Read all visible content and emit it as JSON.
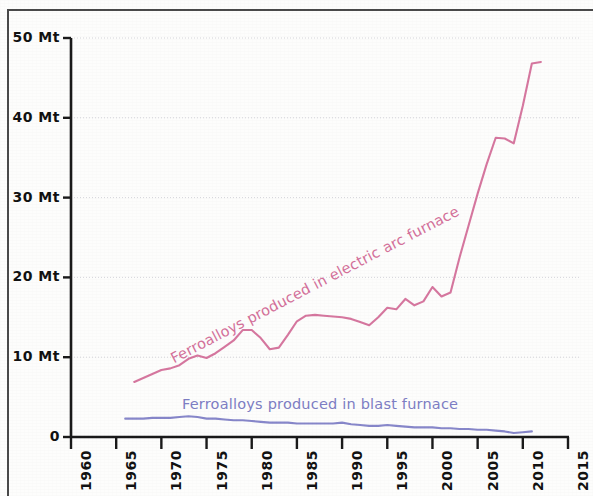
{
  "chart_data": {
    "type": "line",
    "title": "",
    "xlabel": "",
    "ylabel": "",
    "xlim": [
      1960,
      2015
    ],
    "ylim": [
      0,
      50
    ],
    "grid": true,
    "legend_position": "inline-on-series",
    "y_tick_labels": [
      "50 Mt",
      "40 Mt",
      "30 Mt",
      "20 Mt",
      "10 Mt",
      "0"
    ],
    "y_ticks": [
      50,
      40,
      30,
      20,
      10,
      0
    ],
    "x_tick_labels": [
      "1960",
      "1965",
      "1970",
      "1975",
      "1980",
      "1985",
      "1990",
      "1995",
      "2000",
      "2005",
      "2010",
      "2015"
    ],
    "x_ticks": [
      1960,
      1965,
      1970,
      1975,
      1980,
      1985,
      1990,
      1995,
      2000,
      2005,
      2010,
      2015
    ],
    "y_unit": "Mt",
    "series": [
      {
        "name": "Ferroalloys produced in electric arc furnace",
        "color": "#d4709a",
        "x": [
          1967,
          1968,
          1969,
          1970,
          1971,
          1972,
          1973,
          1974,
          1975,
          1976,
          1977,
          1978,
          1979,
          1980,
          1981,
          1982,
          1983,
          1984,
          1985,
          1986,
          1987,
          1988,
          1989,
          1990,
          1991,
          1992,
          1993,
          1994,
          1995,
          1996,
          1997,
          1998,
          1999,
          2000,
          2001,
          2002,
          2003,
          2004,
          2005,
          2006,
          2007,
          2008,
          2009,
          2010,
          2011,
          2012
        ],
        "values": [
          6.9,
          7.4,
          7.9,
          8.4,
          8.6,
          9.0,
          9.8,
          10.2,
          9.9,
          10.5,
          11.3,
          12.1,
          13.4,
          13.4,
          12.4,
          11.0,
          11.2,
          12.8,
          14.5,
          15.2,
          15.3,
          15.2,
          15.1,
          15.0,
          14.8,
          14.4,
          14.0,
          15.0,
          16.2,
          16.0,
          17.3,
          16.5,
          17.0,
          18.8,
          17.6,
          18.1,
          22.5,
          26.5,
          30.5,
          34.2,
          37.5,
          37.4,
          36.8,
          41.5,
          46.8,
          47.0
        ]
      },
      {
        "name": "Ferroalloys produced in blast furnace",
        "color": "#8181c7",
        "x": [
          1966,
          1967,
          1968,
          1969,
          1970,
          1971,
          1972,
          1973,
          1974,
          1975,
          1976,
          1977,
          1978,
          1979,
          1980,
          1981,
          1982,
          1983,
          1984,
          1985,
          1986,
          1987,
          1988,
          1989,
          1990,
          1991,
          1992,
          1993,
          1994,
          1995,
          1996,
          1997,
          1998,
          1999,
          2000,
          2001,
          2002,
          2003,
          2004,
          2005,
          2006,
          2007,
          2008,
          2009,
          2010,
          2011
        ],
        "values": [
          2.3,
          2.3,
          2.3,
          2.4,
          2.4,
          2.4,
          2.5,
          2.6,
          2.5,
          2.3,
          2.3,
          2.2,
          2.1,
          2.1,
          2.0,
          1.9,
          1.8,
          1.8,
          1.8,
          1.7,
          1.7,
          1.7,
          1.7,
          1.7,
          1.8,
          1.6,
          1.5,
          1.4,
          1.4,
          1.5,
          1.4,
          1.3,
          1.2,
          1.2,
          1.2,
          1.1,
          1.1,
          1.0,
          1.0,
          0.9,
          0.9,
          0.8,
          0.7,
          0.5,
          0.6,
          0.7
        ]
      }
    ],
    "annotations": [
      {
        "name": "eaf-inline-label",
        "text": "Ferroalloys produced in electric arc furnace",
        "color": "#d4709a"
      },
      {
        "name": "bf-inline-label",
        "text": "Ferroalloys produced in blast furnace",
        "color": "#7e7ec4"
      }
    ]
  },
  "axes": {
    "y_labels": [
      "50 Mt",
      "40 Mt",
      "30 Mt",
      "20 Mt",
      "10 Mt",
      "0"
    ],
    "x_labels": [
      "1960",
      "1965",
      "1970",
      "1975",
      "1980",
      "1985",
      "1990",
      "1995",
      "2000",
      "2005",
      "2010",
      "2015"
    ]
  },
  "labels": {
    "eaf": "Ferroalloys produced in electric arc furnace",
    "bf": "Ferroalloys produced in blast furnace"
  }
}
